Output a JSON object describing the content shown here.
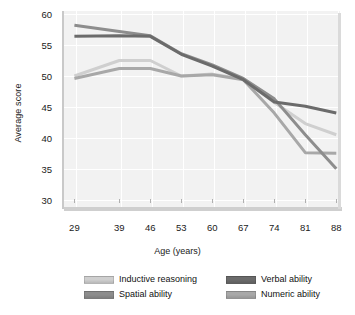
{
  "chart_data": {
    "type": "line",
    "title": "",
    "xlabel": "Age (years)",
    "ylabel": "Average score",
    "x": [
      29,
      39,
      46,
      53,
      60,
      67,
      74,
      81,
      88
    ],
    "xtick_labels": [
      "29",
      "39",
      "46",
      "53",
      "60",
      "67",
      "74",
      "81",
      "88"
    ],
    "ytick_labels": [
      "60",
      "55",
      "50",
      "45",
      "40",
      "35",
      "30"
    ],
    "ylim": [
      28.5,
      60.5
    ],
    "yticks": [
      30,
      35,
      40,
      45,
      50,
      55,
      60
    ],
    "grid": true,
    "legend_position": "bottom",
    "series": [
      {
        "name": "Inductive reasoning",
        "color": "#cfcfcf",
        "values": [
          50.0,
          52.5,
          52.5,
          50.0,
          50.3,
          49.5,
          45.7,
          42.3,
          40.5
        ]
      },
      {
        "name": "Spatial ability",
        "color": "#8d8d8d",
        "values": [
          58.2,
          57.2,
          56.5,
          53.6,
          51.8,
          49.6,
          46.3,
          40.5,
          35.0
        ]
      },
      {
        "name": "Verbal ability",
        "color": "#6b6b6b",
        "values": [
          56.4,
          56.5,
          56.4,
          53.5,
          51.6,
          49.4,
          45.8,
          45.1,
          44.0
        ]
      },
      {
        "name": "Numeric ability",
        "color": "#a8a8a8",
        "values": [
          49.6,
          51.2,
          51.2,
          50.0,
          50.2,
          49.4,
          44.0,
          37.6,
          37.5
        ]
      }
    ]
  },
  "legend": {
    "entries": [
      {
        "label": "Inductive reasoning",
        "color": "#cfcfcf"
      },
      {
        "label": "Verbal ability",
        "color": "#6b6b6b"
      },
      {
        "label": "Spatial ability",
        "color": "#8d8d8d"
      },
      {
        "label": "Numeric ability",
        "color": "#a8a8a8"
      }
    ]
  }
}
